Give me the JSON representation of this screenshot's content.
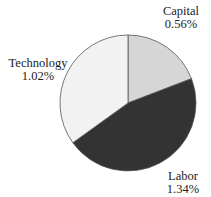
{
  "chart_data": {
    "type": "pie",
    "title": "",
    "slices": [
      {
        "label": "Capital",
        "value": 0.56,
        "display": "0.56%",
        "color": "#d6d6d6"
      },
      {
        "label": "Labor",
        "value": 1.34,
        "display": "1.34%",
        "color": "#333333"
      },
      {
        "label": "Technology",
        "value": 1.02,
        "display": "1.02%",
        "color": "#f2f2f2"
      }
    ],
    "start_angle": "12 o'clock, clockwise",
    "legend": "none (direct labels)"
  },
  "labels": {
    "capital": {
      "name": "Capital",
      "value": "0.56%"
    },
    "labor": {
      "name": "Labor",
      "value": "1.34%"
    },
    "technology": {
      "name": "Technology",
      "value": "1.02%"
    }
  }
}
